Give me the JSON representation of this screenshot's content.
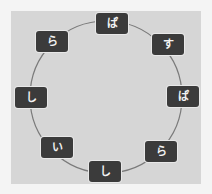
{
  "puzzle": {
    "type": "circular-letter-ring",
    "circle": {
      "cx": 106,
      "cy": 97,
      "r": 76,
      "stroke": "#7a7a7a"
    },
    "colors": {
      "background": "#f4f4f4",
      "panel": "#d6d6d6",
      "tile": "#3b3b3b",
      "tile_text": "#f2f2f2"
    },
    "tiles": [
      {
        "label": "ぱ",
        "x": 96,
        "y": 13
      },
      {
        "label": "す",
        "x": 152,
        "y": 34
      },
      {
        "label": "ぱ",
        "x": 167,
        "y": 86
      },
      {
        "label": "ら",
        "x": 145,
        "y": 141
      },
      {
        "label": "し",
        "x": 89,
        "y": 161
      },
      {
        "label": "い",
        "x": 41,
        "y": 137
      },
      {
        "label": "し",
        "x": 15,
        "y": 87
      },
      {
        "label": "ら",
        "x": 36,
        "y": 31
      }
    ]
  }
}
